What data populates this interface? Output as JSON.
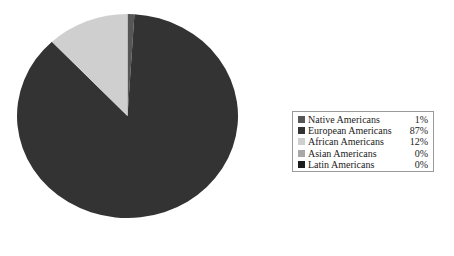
{
  "chart_data": {
    "type": "pie",
    "title": "",
    "subtitle": "",
    "xlabel": "",
    "ylabel": "",
    "grid": false,
    "legend_position": "right",
    "start_angle_deg": 0,
    "direction": "clockwise",
    "categories": [
      "Native Americans",
      "European Americans",
      "African Americans",
      "Asian Americans",
      "Latin Americans"
    ],
    "values": [
      1,
      87,
      12,
      0,
      0
    ],
    "value_labels": [
      "1%",
      "87%",
      "12%",
      "0%",
      "0%"
    ],
    "colors": [
      "#565656",
      "#333333",
      "#cfcfcf",
      "#a8a8a8",
      "#1c1c1c"
    ],
    "slices": [
      {
        "label": "Native Americans",
        "value": 1,
        "value_label": "1%",
        "color": "#565656",
        "visible": true
      },
      {
        "label": "European Americans",
        "value": 87,
        "value_label": "87%",
        "color": "#333333",
        "visible": true
      },
      {
        "label": "African Americans",
        "value": 12,
        "value_label": "12%",
        "color": "#cfcfcf",
        "visible": true
      },
      {
        "label": "Asian Americans",
        "value": 0,
        "value_label": "0%",
        "color": "#a8a8a8",
        "visible": false
      },
      {
        "label": "Latin Americans",
        "value": 0,
        "value_label": "0%",
        "color": "#1c1c1c",
        "visible": false
      }
    ]
  },
  "legend": {
    "rows": [
      {
        "label": "Native Americans",
        "value": "1%",
        "color": "#565656"
      },
      {
        "label": "European Americans",
        "value": "87%",
        "color": "#333333"
      },
      {
        "label": "African Americans",
        "value": "12%",
        "color": "#cfcfcf"
      },
      {
        "label": "Asian Americans",
        "value": "0%",
        "color": "#a8a8a8"
      },
      {
        "label": "Latin Americans",
        "value": "0%",
        "color": "#1c1c1c"
      }
    ],
    "border_color": "#9a9a9a",
    "background": "#ffffff"
  },
  "canvas": {
    "background": "#ffffff"
  }
}
